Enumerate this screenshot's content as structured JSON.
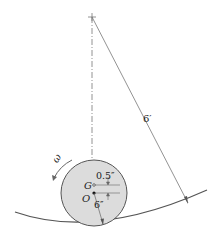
{
  "diagram": {
    "type": "rolling-disk-in-circular-track",
    "labels": {
      "track_radius": "6′",
      "disk_radius": "6″",
      "offset": "0.5″",
      "center_of_mass": "G",
      "geometric_center": "O",
      "angular_velocity": "ω"
    },
    "colors": {
      "disk_fill": "#dcdcdc",
      "line": "#555555",
      "text": "#222222"
    }
  }
}
